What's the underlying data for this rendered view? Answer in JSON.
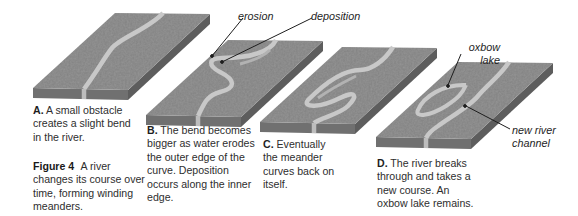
{
  "figure": {
    "number": "Figure 4",
    "caption": "A river changes its course over time, forming winding meanders."
  },
  "stages": [
    {
      "letter": "A.",
      "text": "A small obstacle creates a slight bend in the river."
    },
    {
      "letter": "B.",
      "text": "The bend becomes bigger as water erodes the outer edge of the curve. Deposition occurs along the inner edge."
    },
    {
      "letter": "C.",
      "text": "Eventually the meander curves back on itself."
    },
    {
      "letter": "D.",
      "text": "The river breaks through and takes a new course. An oxbow lake remains."
    }
  ],
  "labels": {
    "erosion": "erosion",
    "deposition": "deposition",
    "oxbow_line1": "oxbow",
    "oxbow_line2": "lake",
    "channel_line1": "new river",
    "channel_line2": "channel"
  },
  "colors": {
    "land_top": "#8f8f8f",
    "land_side": "#6e6e6e",
    "land_side_dark": "#5a5a5a",
    "water": "#c9c9c9",
    "sandbar": "#b4b4b4",
    "text": "#2e2e2e"
  }
}
